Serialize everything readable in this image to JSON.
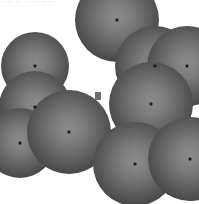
{
  "figure": {
    "width": 199,
    "height": 204,
    "background_color": "#ffffff",
    "header_text": "......  ...  ....  ..  ..  ..",
    "palette": {
      "sphere_center": "#8a8a8a",
      "sphere_edge": "#2c2c2c",
      "sphere_core_dot": "#1d1d1d",
      "artifact": "#6e6e6e",
      "background": "#ffffff",
      "header_text_color": "#b9b9b9"
    },
    "artifact": {
      "name": "gray-square-artifact",
      "x": 95,
      "y": 92,
      "width": 6,
      "height": 8
    },
    "spheres": [
      {
        "id": "sphere-top-left",
        "cx": 35,
        "cy": 66,
        "r": 34,
        "z": 12
      },
      {
        "id": "sphere-top-center",
        "cx": 117,
        "cy": 20,
        "r": 42,
        "z": 11
      },
      {
        "id": "sphere-upper-right-a",
        "cx": 155,
        "cy": 66,
        "r": 40,
        "z": 13
      },
      {
        "id": "sphere-upper-right-b",
        "cx": 187,
        "cy": 66,
        "r": 40,
        "z": 14
      },
      {
        "id": "sphere-mid-left",
        "cx": 35,
        "cy": 107,
        "r": 36,
        "z": 15
      },
      {
        "id": "sphere-mid-right",
        "cx": 151,
        "cy": 104,
        "r": 42,
        "z": 16
      },
      {
        "id": "sphere-lower-left",
        "cx": 20,
        "cy": 143,
        "r": 35,
        "z": 17
      },
      {
        "id": "sphere-lower-center",
        "cx": 69,
        "cy": 132,
        "r": 42,
        "z": 18
      },
      {
        "id": "sphere-bottom-center",
        "cx": 135,
        "cy": 164,
        "r": 42,
        "z": 19
      },
      {
        "id": "sphere-bottom-right",
        "cx": 190,
        "cy": 159,
        "r": 42,
        "z": 20
      }
    ]
  }
}
